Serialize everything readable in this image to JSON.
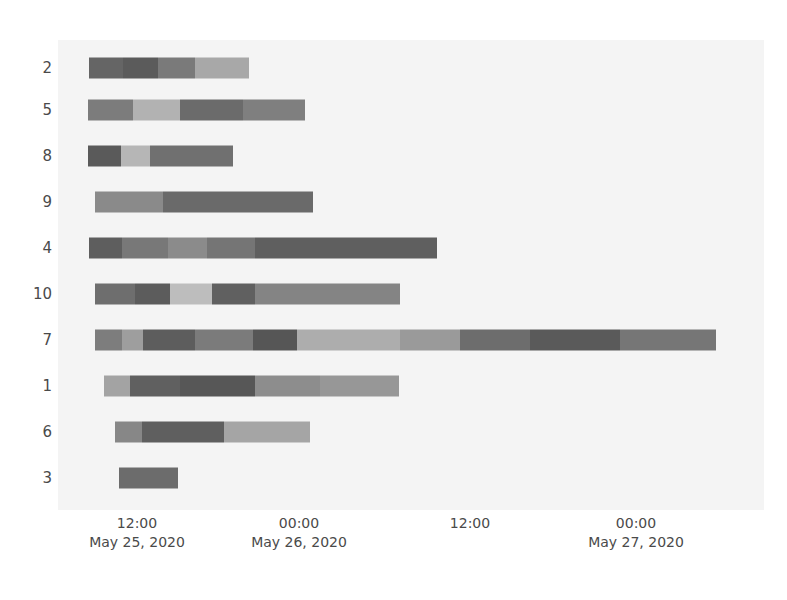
{
  "chart_data": {
    "type": "bar",
    "title": "",
    "xlabel": "",
    "ylabel": "",
    "orientation": "horizontal",
    "style": "gantt-timeline-stacked",
    "grid": false,
    "legend": null,
    "x_axis": {
      "type": "datetime",
      "range_start": "May 25, 2020 06:00",
      "range_end": "May 27, 2020 12:00",
      "tick_labels": [
        {
          "time": "12:00",
          "date": "May 25, 2020",
          "x": 137
        },
        {
          "time": "00:00",
          "date": "May 26, 2020",
          "x": 299
        },
        {
          "time": "12:00",
          "date": "",
          "x": 470
        },
        {
          "time": "00:00",
          "date": "May 27, 2020",
          "x": 636
        }
      ]
    },
    "y_axis": {
      "type": "category",
      "tick_labels": [
        "2",
        "5",
        "8",
        "9",
        "4",
        "10",
        "7",
        "1",
        "6",
        "3"
      ]
    },
    "categories": [
      "2",
      "5",
      "8",
      "9",
      "4",
      "10",
      "7",
      "1",
      "6",
      "3"
    ],
    "bars": [
      {
        "label": "2",
        "row_y": 68,
        "start_px": 89,
        "end_px": 249,
        "segments": [
          {
            "x0": 89,
            "x1": 123,
            "color": "#656565"
          },
          {
            "x0": 123,
            "x1": 158,
            "color": "#5b5b5b"
          },
          {
            "x0": 158,
            "x1": 195,
            "color": "#7a7a7a"
          },
          {
            "x0": 195,
            "x1": 249,
            "color": "#a8a8a8"
          }
        ]
      },
      {
        "label": "5",
        "row_y": 110,
        "start_px": 88,
        "end_px": 305,
        "segments": [
          {
            "x0": 88,
            "x1": 133,
            "color": "#7c7c7c"
          },
          {
            "x0": 133,
            "x1": 180,
            "color": "#b2b2b2"
          },
          {
            "x0": 180,
            "x1": 243,
            "color": "#6b6b6b"
          },
          {
            "x0": 243,
            "x1": 305,
            "color": "#7f7f7f"
          }
        ]
      },
      {
        "label": "8",
        "row_y": 156,
        "start_px": 88,
        "end_px": 233,
        "segments": [
          {
            "x0": 88,
            "x1": 121,
            "color": "#5a5a5a"
          },
          {
            "x0": 121,
            "x1": 150,
            "color": "#b6b6b6"
          },
          {
            "x0": 150,
            "x1": 233,
            "color": "#707070"
          }
        ]
      },
      {
        "label": "9",
        "row_y": 202,
        "start_px": 95,
        "end_px": 313,
        "segments": [
          {
            "x0": 95,
            "x1": 163,
            "color": "#8a8a8a"
          },
          {
            "x0": 163,
            "x1": 313,
            "color": "#6a6a6a"
          }
        ]
      },
      {
        "label": "4",
        "row_y": 248,
        "start_px": 89,
        "end_px": 437,
        "segments": [
          {
            "x0": 89,
            "x1": 122,
            "color": "#5e5e5e"
          },
          {
            "x0": 122,
            "x1": 168,
            "color": "#787878"
          },
          {
            "x0": 168,
            "x1": 207,
            "color": "#8b8b8b"
          },
          {
            "x0": 207,
            "x1": 255,
            "color": "#757575"
          },
          {
            "x0": 255,
            "x1": 437,
            "color": "#5f5f5f"
          }
        ]
      },
      {
        "label": "10",
        "row_y": 294,
        "start_px": 95,
        "end_px": 400,
        "segments": [
          {
            "x0": 95,
            "x1": 135,
            "color": "#6e6e6e"
          },
          {
            "x0": 135,
            "x1": 170,
            "color": "#5c5c5c"
          },
          {
            "x0": 170,
            "x1": 212,
            "color": "#bdbdbd"
          },
          {
            "x0": 212,
            "x1": 255,
            "color": "#606060"
          },
          {
            "x0": 255,
            "x1": 400,
            "color": "#848484"
          }
        ]
      },
      {
        "label": "7",
        "row_y": 340,
        "start_px": 95,
        "end_px": 716,
        "segments": [
          {
            "x0": 95,
            "x1": 122,
            "color": "#7d7d7d"
          },
          {
            "x0": 122,
            "x1": 143,
            "color": "#9e9e9e"
          },
          {
            "x0": 143,
            "x1": 195,
            "color": "#5d5d5d"
          },
          {
            "x0": 195,
            "x1": 253,
            "color": "#7b7b7b"
          },
          {
            "x0": 253,
            "x1": 297,
            "color": "#565656"
          },
          {
            "x0": 297,
            "x1": 400,
            "color": "#adadad"
          },
          {
            "x0": 400,
            "x1": 460,
            "color": "#9a9a9a"
          },
          {
            "x0": 460,
            "x1": 530,
            "color": "#6d6d6d"
          },
          {
            "x0": 530,
            "x1": 620,
            "color": "#5a5a5a"
          },
          {
            "x0": 620,
            "x1": 716,
            "color": "#767676"
          }
        ]
      },
      {
        "label": "1",
        "row_y": 386,
        "start_px": 104,
        "end_px": 399,
        "segments": [
          {
            "x0": 104,
            "x1": 130,
            "color": "#a3a3a3"
          },
          {
            "x0": 130,
            "x1": 180,
            "color": "#606060"
          },
          {
            "x0": 180,
            "x1": 255,
            "color": "#575757"
          },
          {
            "x0": 255,
            "x1": 320,
            "color": "#8d8d8d"
          },
          {
            "x0": 320,
            "x1": 399,
            "color": "#979797"
          }
        ]
      },
      {
        "label": "6",
        "row_y": 432,
        "start_px": 115,
        "end_px": 310,
        "segments": [
          {
            "x0": 115,
            "x1": 142,
            "color": "#878787"
          },
          {
            "x0": 142,
            "x1": 224,
            "color": "#5f5f5f"
          },
          {
            "x0": 224,
            "x1": 310,
            "color": "#a5a5a5"
          }
        ]
      },
      {
        "label": "3",
        "row_y": 478,
        "start_px": 119,
        "end_px": 178,
        "segments": [
          {
            "x0": 119,
            "x1": 178,
            "color": "#6c6c6c"
          }
        ]
      }
    ],
    "colors": {
      "plot_background": "#f4f4f4",
      "page_background": "#ffffff",
      "tick_label": "#4a4a4a"
    }
  }
}
